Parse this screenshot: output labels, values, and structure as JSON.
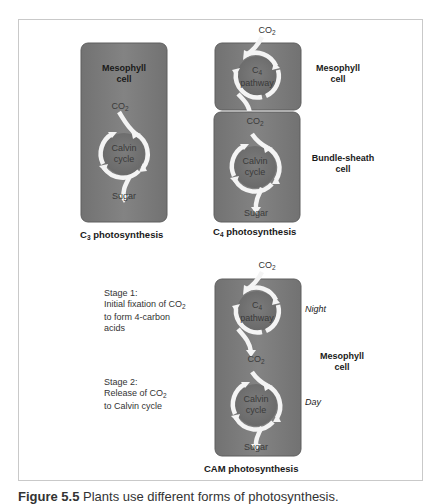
{
  "figure": {
    "caption_prefix": "Figure 5.5",
    "caption_text": "Plants use different forms of photosynthesis."
  },
  "colors": {
    "cell_fill": "#7b7b7b",
    "cell_border": "#5f5f5f",
    "cycle_inner": "#6e6e6e",
    "arrow": "#f4f4f4",
    "frame_border": "#c9c9c9"
  },
  "c3": {
    "title_prefix": "C",
    "title_sub": "3",
    "title_suffix": " photosynthesis",
    "cell_label_line1": "Mesophyll",
    "cell_label_line2": "cell",
    "input_prefix": "CO",
    "input_sub": "2",
    "cycle_line1": "Calvin",
    "cycle_line2": "cycle",
    "output": "Sugar"
  },
  "c4": {
    "title_prefix": "C",
    "title_sub": "4",
    "title_suffix": " photosynthesis",
    "top_input_prefix": "CO",
    "top_input_sub": "2",
    "pathway_prefix": "C",
    "pathway_sub": "4",
    "pathway_line2": "pathway",
    "mid_co2_prefix": "CO",
    "mid_co2_sub": "2",
    "cycle_line1": "Calvin",
    "cycle_line2": "cycle",
    "output": "Sugar",
    "mesophyll_line1": "Mesophyll",
    "mesophyll_line2": "cell",
    "bundle_line1": "Bundle-sheath",
    "bundle_line2": "cell"
  },
  "cam": {
    "title": "CAM photosynthesis",
    "top_input_prefix": "CO",
    "top_input_sub": "2",
    "pathway_prefix": "C",
    "pathway_sub": "4",
    "pathway_line2": "pathway",
    "mid_co2_prefix": "CO",
    "mid_co2_sub": "2",
    "cycle_line1": "Calvin",
    "cycle_line2": "cycle",
    "output": "Sugar",
    "night": "Night",
    "day": "Day",
    "mesophyll_line1": "Mesophyll",
    "mesophyll_line2": "cell",
    "stage1": {
      "title": "Stage 1:",
      "line2_prefix": "Initial fixation of CO",
      "line2_sub": "2",
      "line3": "to form 4-carbon",
      "line4": "acids"
    },
    "stage2": {
      "title": "Stage 2:",
      "line2_prefix": "Release of CO",
      "line2_sub": "2",
      "line3": "to Calvin cycle"
    }
  }
}
